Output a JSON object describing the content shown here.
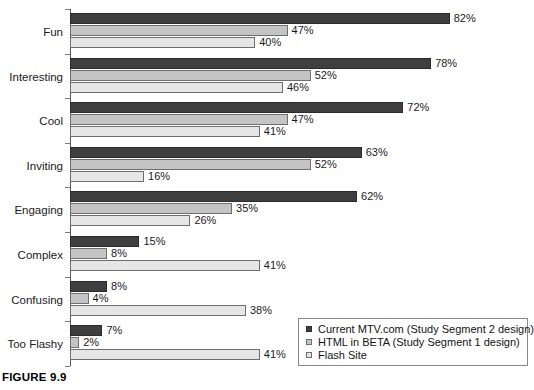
{
  "caption": "FIGURE 9.9",
  "legend": {
    "position": "bottom-right",
    "items": [
      {
        "label": "Current MTV.com (Study Segment 2 design)",
        "color": "#3f3f3f",
        "swatch": "legend-swatch-dark"
      },
      {
        "label": "HTML in BETA (Study Segment 1 design)",
        "color": "#c4c4c4",
        "swatch": "legend-swatch-medium"
      },
      {
        "label": "Flash Site",
        "color": "#e6e6e6",
        "swatch": "legend-swatch-light"
      }
    ]
  },
  "chart_data": {
    "type": "bar",
    "orientation": "horizontal",
    "title": "",
    "xlabel": "",
    "ylabel": "",
    "xlim": [
      0,
      82
    ],
    "grid": false,
    "legend_position": "bottom-right",
    "value_suffix": "%",
    "categories": [
      "Fun",
      "Interesting",
      "Cool",
      "Inviting",
      "Engaging",
      "Complex",
      "Confusing",
      "Too Flashy"
    ],
    "series": [
      {
        "name": "Current MTV.com (Study Segment 2 design)",
        "color": "#3f3f3f",
        "values": [
          82,
          78,
          72,
          63,
          62,
          15,
          8,
          7
        ],
        "labels": [
          "82%",
          "78%",
          "72%",
          "63%",
          "62%",
          "15%",
          "8%",
          "7%"
        ]
      },
      {
        "name": "HTML in BETA (Study Segment 1 design)",
        "color": "#c4c4c4",
        "values": [
          47,
          52,
          47,
          52,
          35,
          8,
          4,
          2
        ],
        "labels": [
          "47%",
          "52%",
          "47%",
          "52%",
          "35%",
          "8%",
          "4%",
          "2%"
        ]
      },
      {
        "name": "Flash Site",
        "color": "#e6e6e6",
        "values": [
          40,
          46,
          41,
          16,
          26,
          41,
          38,
          41
        ],
        "labels": [
          "40%",
          "46%",
          "41%",
          "16%",
          "26%",
          "41%",
          "38%",
          "41%"
        ]
      }
    ]
  }
}
